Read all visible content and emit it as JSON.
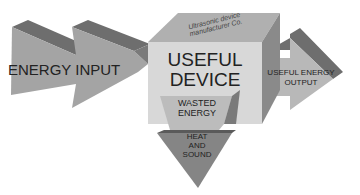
{
  "diagram": {
    "input_label": "ENERGY INPUT",
    "device_label_line1": "USEFUL",
    "device_label_line2": "DEVICE",
    "device_top_label": "Ultrasonic device manufacturer Co.",
    "output_label_line1": "USEFUL ENERGY",
    "output_label_line2": "OUTPUT",
    "wasted_label_line1": "WASTED",
    "wasted_label_line2": "ENERGY",
    "heat_label_line1": "HEAT",
    "heat_label_line2": "AND",
    "heat_label_line3": "SOUND",
    "colors": {
      "arrow_face": "#a4a4a4",
      "arrow_top": "#6e6e6e",
      "cube_face": "#d8d8d8",
      "cube_top": "#b0b0b0",
      "cube_side": "#8a8a8a"
    }
  }
}
